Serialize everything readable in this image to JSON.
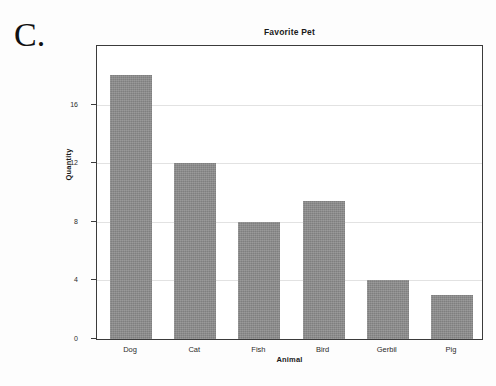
{
  "panel": {
    "label": "C."
  },
  "chart_data": {
    "type": "bar",
    "title": "Favorite Pet",
    "xlabel": "Animal",
    "ylabel": "Quantity",
    "categories": [
      "Dog",
      "Cat",
      "Fish",
      "Bird",
      "Gerbil",
      "Pig"
    ],
    "values": [
      18,
      12,
      8,
      9.4,
      4,
      3
    ],
    "ylim": [
      0,
      20
    ],
    "yticks": [
      0,
      4,
      8,
      12,
      16
    ],
    "ytick_labels": [
      "0",
      "4",
      "8",
      "12",
      "16"
    ],
    "grid": true,
    "grid_axis": "y",
    "legend": null,
    "bar_color": "#8b8b8b",
    "frame_color": "#3b3b3b",
    "gridline_color": "#e2e2e2",
    "background_color": "#ffffff"
  }
}
